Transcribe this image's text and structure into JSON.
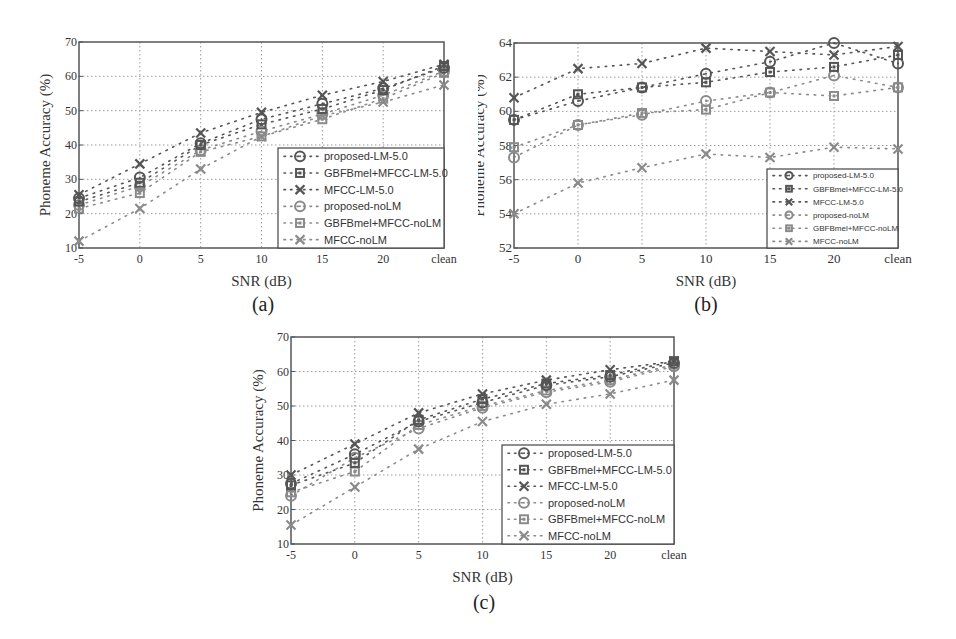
{
  "figure_captions": [
    "(a)",
    "(b)",
    "(c)"
  ],
  "chart_data": [
    {
      "id": "a",
      "type": "line",
      "title": "",
      "caption": "(a)",
      "xlabel": "SNR (dB)",
      "ylabel": "Phoneme Accuracy (%)",
      "categories": [
        "-5",
        "0",
        "5",
        "10",
        "15",
        "20",
        "clean"
      ],
      "ylim": [
        10,
        70
      ],
      "yticks": [
        10,
        20,
        30,
        40,
        50,
        60,
        70
      ],
      "grid": true,
      "legend_position": "lower right",
      "series": [
        {
          "name": "proposed-LM-5.0",
          "marker": "circle",
          "style": "dark",
          "values": [
            24.5,
            30.5,
            40.5,
            47.5,
            52,
            56.5,
            62.5
          ]
        },
        {
          "name": "GBFBmel+MFCC-LM-5.0",
          "marker": "square",
          "style": "dark",
          "values": [
            23.5,
            29,
            40,
            46,
            50.5,
            56,
            63
          ]
        },
        {
          "name": "MFCC-LM-5.0",
          "marker": "x",
          "style": "dark",
          "values": [
            25.5,
            34.5,
            43.5,
            49.5,
            54.5,
            58.5,
            63.5
          ]
        },
        {
          "name": "proposed-noLM",
          "marker": "circle",
          "style": "light",
          "values": [
            22.5,
            28,
            38.5,
            44,
            49,
            54.5,
            61.5
          ]
        },
        {
          "name": "GBFBmel+MFCC-noLM",
          "marker": "square",
          "style": "light",
          "values": [
            21.5,
            26,
            38,
            42.5,
            47.5,
            53.5,
            61
          ]
        },
        {
          "name": "MFCC-noLM",
          "marker": "x",
          "style": "light",
          "values": [
            12,
            21.5,
            33,
            42.5,
            48.5,
            52.5,
            57.5
          ]
        }
      ]
    },
    {
      "id": "b",
      "type": "line",
      "title": "",
      "caption": "(b)",
      "xlabel": "SNR (dB)",
      "ylabel": "Phoneme Accuracy (%)",
      "categories": [
        "-5",
        "0",
        "5",
        "10",
        "15",
        "20",
        "clean"
      ],
      "ylim": [
        52,
        64
      ],
      "yticks": [
        52,
        54,
        56,
        58,
        60,
        62,
        64
      ],
      "grid": true,
      "legend_position": "lower right",
      "series": [
        {
          "name": "proposed-LM-5.0",
          "marker": "circle",
          "style": "dark",
          "values": [
            59.5,
            60.6,
            61.4,
            62.2,
            62.9,
            64.0,
            62.8
          ]
        },
        {
          "name": "GBFBmel+MFCC-LM-5.0",
          "marker": "square",
          "style": "dark",
          "values": [
            59.5,
            61.0,
            61.4,
            61.7,
            62.3,
            62.6,
            63.3
          ]
        },
        {
          "name": "MFCC-LM-5.0",
          "marker": "x",
          "style": "dark",
          "values": [
            60.8,
            62.5,
            62.8,
            63.7,
            63.5,
            63.3,
            63.8
          ]
        },
        {
          "name": "proposed-noLM",
          "marker": "circle",
          "style": "light",
          "values": [
            57.3,
            59.2,
            59.8,
            60.6,
            61.1,
            62.1,
            61.4
          ]
        },
        {
          "name": "GBFBmel+MFCC-noLM",
          "marker": "square",
          "style": "light",
          "values": [
            57.9,
            59.2,
            59.9,
            60.1,
            61.1,
            60.9,
            61.4
          ]
        },
        {
          "name": "MFCC-noLM",
          "marker": "x",
          "style": "light",
          "values": [
            54.0,
            55.8,
            56.7,
            57.5,
            57.3,
            57.9,
            57.8
          ]
        }
      ]
    },
    {
      "id": "c",
      "type": "line",
      "title": "",
      "caption": "(c)",
      "xlabel": "SNR (dB)",
      "ylabel": "Phoneme Accuracy (%)",
      "categories": [
        "-5",
        "0",
        "5",
        "10",
        "15",
        "20",
        "clean"
      ],
      "ylim": [
        10,
        70
      ],
      "yticks": [
        10,
        20,
        30,
        40,
        50,
        60,
        70
      ],
      "grid": true,
      "legend_position": "lower right",
      "series": [
        {
          "name": "proposed-LM-5.0",
          "marker": "circle",
          "style": "dark",
          "values": [
            27.5,
            36,
            45.5,
            51,
            56,
            58.5,
            62.5
          ]
        },
        {
          "name": "GBFBmel+MFCC-LM-5.0",
          "marker": "square",
          "style": "dark",
          "values": [
            27,
            33.5,
            46,
            52,
            56.5,
            59,
            63
          ]
        },
        {
          "name": "MFCC-LM-5.0",
          "marker": "x",
          "style": "dark",
          "values": [
            30,
            39,
            48,
            53.5,
            57.5,
            60.5,
            63
          ]
        },
        {
          "name": "proposed-noLM",
          "marker": "circle",
          "style": "light",
          "values": [
            24,
            35,
            43.5,
            49.5,
            54,
            57,
            61.5
          ]
        },
        {
          "name": "GBFBmel+MFCC-noLM",
          "marker": "square",
          "style": "light",
          "values": [
            25,
            31,
            44.5,
            50,
            54.5,
            57.5,
            62
          ]
        },
        {
          "name": "MFCC-noLM",
          "marker": "x",
          "style": "light",
          "values": [
            15.5,
            26.5,
            37.5,
            45.5,
            50.5,
            53.5,
            57.5
          ]
        }
      ]
    }
  ],
  "colors": {
    "dark_series": "#555555",
    "light_series": "#8a8a8a",
    "grid": "#9a9a9a",
    "axis": "#555555",
    "legend_border": "#444444"
  }
}
